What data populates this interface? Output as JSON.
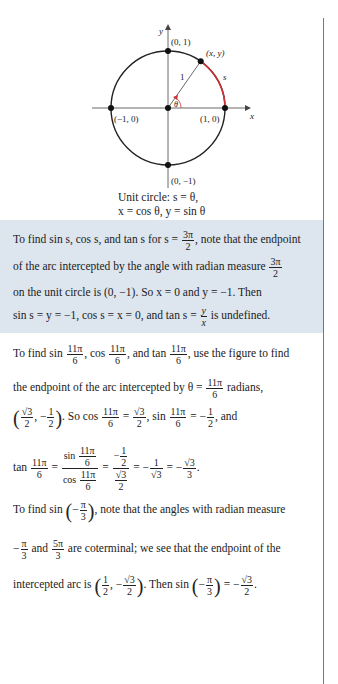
{
  "figure": {
    "type": "unit-circle-diagram",
    "labels": {
      "y_axis": "y",
      "x_axis": "x",
      "top": "(0, 1)",
      "bottom": "(0, −1)",
      "left": "(−1, 0)",
      "right": "(1, 0)",
      "point": "(x, y)",
      "radius": "1",
      "arc": "s",
      "angle": "θ"
    },
    "arc_color": "#d03030",
    "caption_line1": "Unit circle: s = θ,",
    "caption_line2": "x = cos θ, y = sin θ"
  },
  "box": {
    "background": "#dde5ee",
    "l1_a": "To find sin s, cos s, and tan s for s =",
    "l1_frac_n": "3π",
    "l1_frac_d": "2",
    "l1_b": ", note that the endpoint",
    "l2_a": "of the arc intercepted by the angle with radian measure",
    "l2_frac_n": "3π",
    "l2_frac_d": "2",
    "l3": "on the unit circle is (0, −1). So x = 0 and y = −1. Then",
    "l4_a": "sin s = y = −1, cos s = x = 0, and tan s =",
    "l4_frac_n": "y",
    "l4_frac_d": "x",
    "l4_b": "is undefined."
  },
  "ex2": {
    "l1_a": "To find sin",
    "l1_b": ", cos",
    "l1_c": ", and tan",
    "l1_d": ", use the figure to find",
    "f11pi_n": "11π",
    "f11pi_d": "6",
    "l2_a": "the endpoint of the arc intercepted by θ =",
    "l2_b": "radians,",
    "l3_pt_a_n": "√3",
    "l3_pt_a_d": "2",
    "l3_pt_b_n": "1",
    "l3_pt_b_d": "2",
    "l3_so": ". So cos",
    "l3_eq": "=",
    "l3_sin": ", sin",
    "l3_eqneg": "= −",
    "l3_and": ", and",
    "l4_tan": "tan",
    "l4_sin": "sin",
    "l4_cos": "cos",
    "l4_r1": "= −",
    "l4_one": "1",
    "l4_sqrt3": "√3",
    "l4_three": "3",
    "l4_end": "."
  },
  "ex3": {
    "l1_a": "To find sin",
    "l1_b": ", note that the angles with radian measure",
    "pi": "π",
    "three": "3",
    "l2_and": "and",
    "l2_5pi": "5π",
    "l2_b": "are coterminal; we see that the endpoint of the",
    "l3_a": "intercepted arc is",
    "l3_then": ". Then sin",
    "l3_eq": "= −",
    "one": "1",
    "two": "2",
    "sqrt3": "√3"
  }
}
